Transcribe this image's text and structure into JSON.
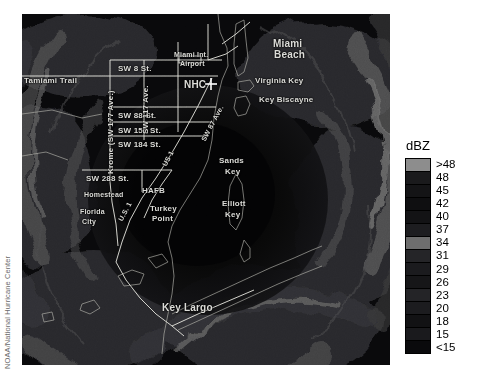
{
  "credit": {
    "text": "NOAA/National Hurricane Center"
  },
  "legend": {
    "title": "dBZ",
    "units": "dBZ",
    "labels": [
      ">48",
      "48",
      "45",
      "42",
      "40",
      "37",
      "34",
      "31",
      "29",
      "26",
      "23",
      "20",
      "18",
      "15",
      "<15"
    ],
    "colors": [
      "#8d8d8d",
      "#1a1a1c",
      "#141416",
      "#0f0f11",
      "#131315",
      "#1d1d20",
      "#6e6e6e",
      "#252528",
      "#1b1b1e",
      "#161618",
      "#242427",
      "#1c1c1f",
      "#121214",
      "#1a1a1d",
      "#0a0a0c"
    ]
  },
  "map": {
    "places": [
      {
        "name": "Tamiami Trail",
        "text": "Tamiami Trail",
        "x": 2,
        "y": 62,
        "cls": "lbl"
      },
      {
        "name": "SW 8 St.",
        "text": "SW 8 St.",
        "x": 96,
        "y": 50,
        "cls": "lbl"
      },
      {
        "name": "Miami Int. Airport",
        "text": "Miami Int.",
        "x": 152,
        "y": 37,
        "cls": "lbl small"
      },
      {
        "name": "Airport",
        "text": "Airport",
        "x": 158,
        "y": 46,
        "cls": "lbl small"
      },
      {
        "name": "NHC",
        "text": "NHC",
        "x": 162,
        "y": 65,
        "cls": "lbl big"
      },
      {
        "name": "Miami Beach",
        "text": "Miami",
        "x": 251,
        "y": 24,
        "cls": "lbl big"
      },
      {
        "name": "Miami Beach 2",
        "text": "Beach",
        "x": 252,
        "y": 35,
        "cls": "lbl big"
      },
      {
        "name": "Virginia Key",
        "text": "Virginia Key",
        "x": 233,
        "y": 62,
        "cls": "lbl"
      },
      {
        "name": "Key Biscayne",
        "text": "Key Biscayne",
        "x": 237,
        "y": 81,
        "cls": "lbl"
      },
      {
        "name": "SW 88 St.",
        "text": "SW 88 St.",
        "x": 96,
        "y": 97,
        "cls": "lbl"
      },
      {
        "name": "SW 152 St.",
        "text": "SW 152 St.",
        "x": 96,
        "y": 112,
        "cls": "lbl"
      },
      {
        "name": "SW 184 St.",
        "text": "SW 184 St.",
        "x": 96,
        "y": 126,
        "cls": "lbl"
      },
      {
        "name": "SW 288 St.",
        "text": "SW 288 St.",
        "x": 64,
        "y": 160,
        "cls": "lbl"
      },
      {
        "name": "Homestead",
        "text": "Homestead",
        "x": 62,
        "y": 177,
        "cls": "lbl small"
      },
      {
        "name": "HAFB",
        "text": "HAFB",
        "x": 120,
        "y": 172,
        "cls": "lbl"
      },
      {
        "name": "Florida City",
        "text": "Florida",
        "x": 58,
        "y": 194,
        "cls": "lbl small"
      },
      {
        "name": "Florida City 2",
        "text": "City",
        "x": 60,
        "y": 204,
        "cls": "lbl small"
      },
      {
        "name": "Turkey Point",
        "text": "Turkey",
        "x": 128,
        "y": 190,
        "cls": "lbl"
      },
      {
        "name": "Turkey Point 2",
        "text": "Point",
        "x": 130,
        "y": 200,
        "cls": "lbl"
      },
      {
        "name": "Sands Key",
        "text": "Sands",
        "x": 197,
        "y": 142,
        "cls": "lbl"
      },
      {
        "name": "Sands Key 2",
        "text": "Key",
        "x": 203,
        "y": 153,
        "cls": "lbl"
      },
      {
        "name": "Elliott Key",
        "text": "Elliott",
        "x": 200,
        "y": 185,
        "cls": "lbl"
      },
      {
        "name": "Elliott Key 2",
        "text": "Key",
        "x": 203,
        "y": 196,
        "cls": "lbl"
      },
      {
        "name": "Key Largo",
        "text": "Key Largo",
        "x": 140,
        "y": 288,
        "cls": "lbl big"
      }
    ],
    "vertical_labels": [
      {
        "name": "Krome Ave",
        "text": "Krome (SW 177 Ave.)",
        "x": 84,
        "y": 160
      },
      {
        "name": "SW 117 Ave",
        "text": "SW 117 Ave.",
        "x": 119,
        "y": 120
      }
    ],
    "diagonal_labels": [
      {
        "name": "SW 87 Ave",
        "text": "SW 87 Ave.",
        "x": 178,
        "y": 125
      },
      {
        "name": "US 1 north",
        "text": "US 1",
        "x": 139,
        "y": 150
      },
      {
        "name": "US 1 south",
        "text": "U.S. 1",
        "x": 95,
        "y": 205
      }
    ]
  }
}
